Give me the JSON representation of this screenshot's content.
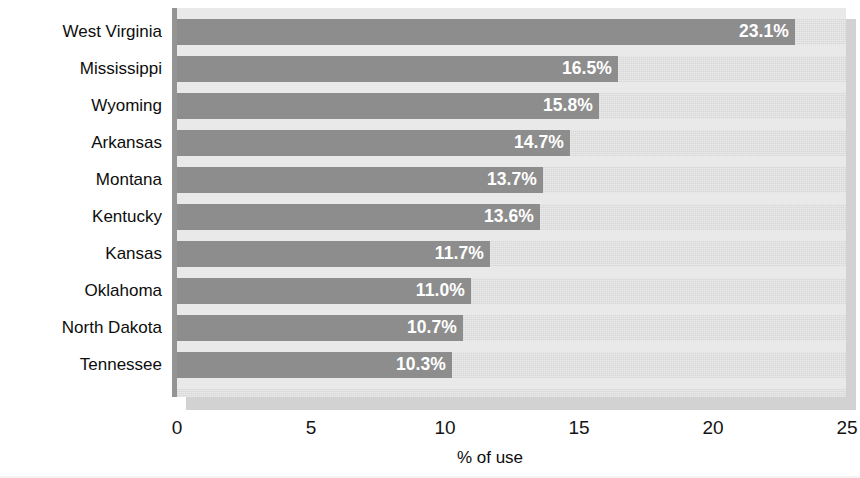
{
  "chart_data": {
    "type": "bar",
    "orientation": "horizontal",
    "title": "",
    "subtitle": "",
    "xlabel": "% of use",
    "ylabel": "",
    "xlim": [
      0,
      25
    ],
    "xticks": [
      0,
      5,
      10,
      15,
      20,
      25
    ],
    "xtick_labels": [
      "0",
      "5",
      "10",
      "15",
      "20",
      "25"
    ],
    "grid": false,
    "legend": false,
    "legend_position": "none",
    "categories": [
      "West Virginia",
      "Mississippi",
      "Wyoming",
      "Arkansas",
      "Montana",
      "Kentucky",
      "Kansas",
      "Oklahoma",
      "North Dakota",
      "Tennessee"
    ],
    "values": [
      23.1,
      16.5,
      15.8,
      14.7,
      13.7,
      13.6,
      11.7,
      11.0,
      10.7,
      10.3
    ],
    "data_labels": [
      "23.1%",
      "16.5%",
      "15.8%",
      "14.7%",
      "13.7%",
      "13.6%",
      "11.7%",
      "11.0%",
      "10.7%",
      "10.3%"
    ],
    "colors": {
      "bar": "#8d8d8d",
      "plot_background": "#dedede",
      "band": "#e9e9e9",
      "axis_line": "#949494",
      "data_label_text": "#ffffff",
      "tick_text": "#141414",
      "category_text": "#0d0d0d",
      "page_background": "#ffffff",
      "shadow": "#d2d2d2"
    }
  }
}
